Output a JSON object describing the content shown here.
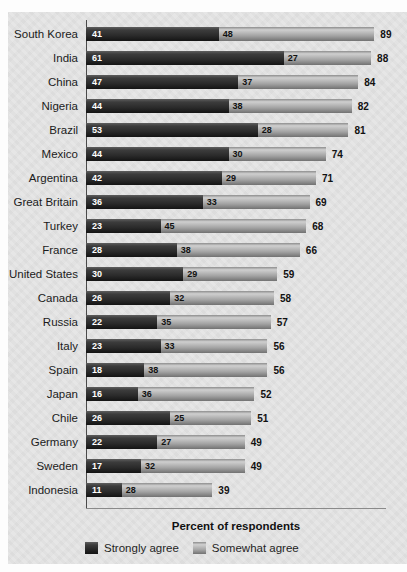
{
  "chart_data": {
    "type": "bar",
    "orientation": "horizontal",
    "stacked": true,
    "title": "",
    "xlabel": "Percent of respondents",
    "ylabel": "",
    "xlim": [
      0,
      100
    ],
    "grid": false,
    "legend_position": "bottom",
    "categories": [
      "South Korea",
      "India",
      "China",
      "Nigeria",
      "Brazil",
      "Mexico",
      "Argentina",
      "Great Britain",
      "Turkey",
      "France",
      "United States",
      "Canada",
      "Russia",
      "Italy",
      "Spain",
      "Japan",
      "Chile",
      "Germany",
      "Sweden",
      "Indonesia"
    ],
    "series": [
      {
        "name": "Strongly agree",
        "color": "#343434",
        "values": [
          41,
          61,
          47,
          44,
          53,
          44,
          42,
          36,
          23,
          28,
          30,
          26,
          22,
          23,
          18,
          16,
          26,
          22,
          17,
          11
        ]
      },
      {
        "name": "Somewhat agree",
        "color": "#a2a2a2",
        "values": [
          48,
          27,
          37,
          38,
          28,
          30,
          29,
          33,
          45,
          38,
          29,
          32,
          35,
          33,
          38,
          36,
          25,
          27,
          32,
          28
        ]
      }
    ],
    "totals": [
      89,
      88,
      84,
      82,
      81,
      74,
      71,
      69,
      68,
      66,
      59,
      58,
      57,
      56,
      56,
      52,
      51,
      49,
      49,
      39
    ]
  },
  "colors": {
    "strongly_agree": "#343434",
    "somewhat_agree": "#a2a2a2",
    "card_background": "#e4e4e4",
    "page_background": "#fdfdfd",
    "value_text_on_dark": "#ffffff",
    "value_text_on_light": "#111111"
  }
}
